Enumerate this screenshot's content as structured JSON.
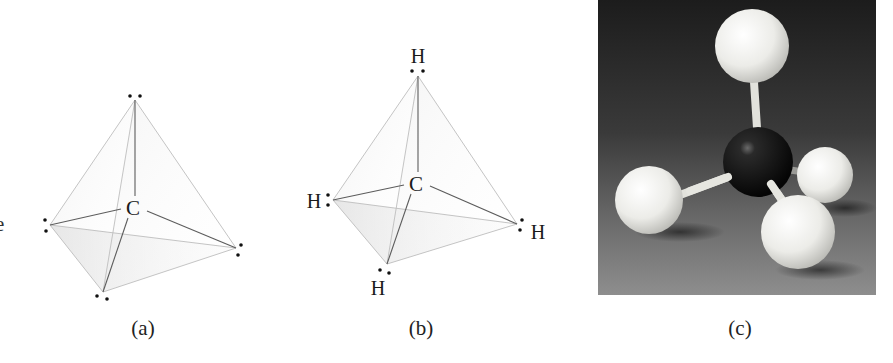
{
  "figure": {
    "clipped_left_text": "e",
    "panels": [
      {
        "id": "a",
        "caption": "(a)",
        "center_label": "C",
        "vertex_labels": [],
        "electron_pairs": 4,
        "content": "Tetrahedron with carbon at center and four electron pairs (dot pairs) at the vertices"
      },
      {
        "id": "b",
        "caption": "(b)",
        "center_label": "C",
        "vertex_labels": [
          "H",
          "H",
          "H",
          "H"
        ],
        "electron_pairs": 4,
        "content": "Tetrahedron with carbon at center and a hydrogen sharing an electron pair at each vertex"
      },
      {
        "id": "c",
        "caption": "(c)",
        "content": "Photograph of a ball-and-stick model of methane: black carbon ball and four white hydrogen balls",
        "atoms": {
          "carbon": {
            "color": "#111111",
            "count": 1
          },
          "hydrogen": {
            "color": "#f2f2ee",
            "count": 4
          }
        },
        "background_gradient": [
          "#1e1e1e",
          "#8a8a8a"
        ]
      }
    ]
  },
  "labels": {
    "C": "C",
    "H": "H"
  },
  "colors": {
    "edge": "#b8b8b8",
    "bond": "#555555",
    "face_shade": "#d9d9d9",
    "dot": "#111111"
  }
}
